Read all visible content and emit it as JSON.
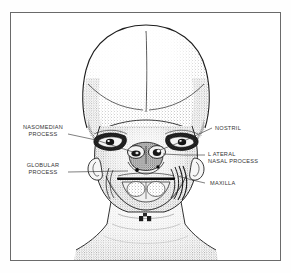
{
  "figure": {
    "style": "stipple-line-engraving",
    "ink_color": "#1d1d1d",
    "paper_color": "#ffffff",
    "frame_color": "#6a6a6a",
    "label_color": "#343434"
  },
  "labels": [
    {
      "id": "nasomedian-process",
      "side": "left",
      "line1": "NASOMEDIAN",
      "line2": "PROCESS",
      "text": "NASOMEDIAN PROCESS"
    },
    {
      "id": "globular-process",
      "side": "left",
      "line1": "GLOBULAR",
      "line2": "PROCESS",
      "text": "GLOBULAR PROCESS"
    },
    {
      "id": "nostril",
      "side": "right",
      "line1": "NOSTRIL",
      "line2": "",
      "text": "NOSTRIL"
    },
    {
      "id": "lateral-nasal-process",
      "side": "right",
      "line1": "L ATERAL",
      "line2": "NASAL  PROCESS",
      "text": "LATERAL NASAL PROCESS"
    },
    {
      "id": "maxilla",
      "side": "right",
      "line1": "MAXILLA",
      "line2": "",
      "text": "MAXILLA"
    }
  ]
}
